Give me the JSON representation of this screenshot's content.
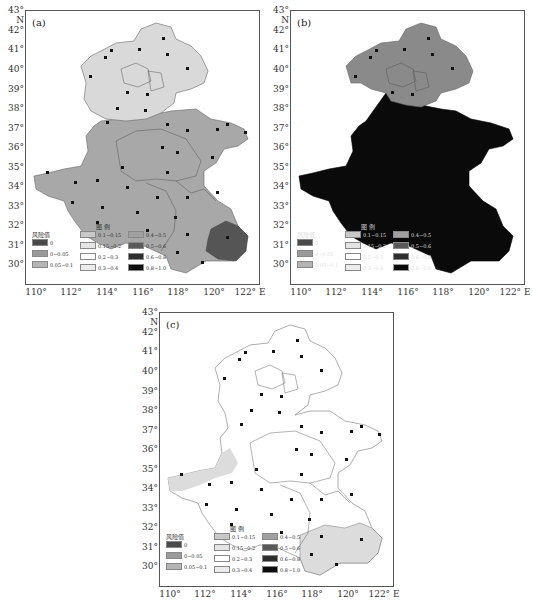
{
  "figure": {
    "panels": [
      {
        "id": "a",
        "label": "(a)"
      },
      {
        "id": "b",
        "label": "(b)"
      },
      {
        "id": "c",
        "label": "(c)"
      }
    ],
    "y_ticks": [
      "43° N",
      "42°",
      "41°",
      "40°",
      "39°",
      "38°",
      "37°",
      "36°",
      "35°",
      "34°",
      "33°",
      "32°",
      "31°",
      "30°"
    ],
    "x_ticks": [
      "110°",
      "112°",
      "114°",
      "116°",
      "118°",
      "120°",
      "122° E"
    ],
    "legend": {
      "title": "图  例",
      "header": "风险值",
      "items": [
        {
          "label": "0",
          "color": "#4a4a4a"
        },
        {
          "label": "0~0.05",
          "color": "#9a9a9a"
        },
        {
          "label": "0.05~0.1",
          "color": "#b4b4b4"
        },
        {
          "label": "0.1~0.15",
          "color": "#c8c8c8"
        },
        {
          "label": "0.15~0.2",
          "color": "#e4e4e4"
        },
        {
          "label": "0.2~0.3",
          "color": "#ffffff"
        },
        {
          "label": "0.3~0.4",
          "color": "#ececec"
        },
        {
          "label": "0.4~0.5",
          "color": "#a0a0a0"
        },
        {
          "label": "0.5~0.6",
          "color": "#5a5a5a"
        },
        {
          "label": "0.6~0.8",
          "color": "#2e2e2e"
        },
        {
          "label": "0.8~1.0",
          "color": "#0c0c0c"
        }
      ]
    },
    "map_labels": {
      "beijing": "北京市",
      "tianjin": "天津市",
      "hebei": "河北省",
      "shandong": "山东省",
      "henan": "河南省",
      "anhui": "安徽省",
      "jiangsu": "江苏省",
      "stations_sample": [
        "围场",
        "张北",
        "张家口",
        "丰宁",
        "承德",
        "怀来",
        "遵化",
        "秦皇岛",
        "蔚县",
        "保定",
        "霸州",
        "天津",
        "塘沽",
        "石家庄",
        "饶阳",
        "黄骅",
        "邢台",
        "南宫",
        "德州",
        "惠民",
        "龙口",
        "烟台",
        "威海",
        "成山头",
        "潍坊",
        "济南",
        "泰山",
        "青岛",
        "日照",
        "三门峡",
        "卢氏",
        "郑州",
        "开封",
        "商丘",
        "许昌",
        "驻马店",
        "信阳",
        "徐州",
        "淮阴",
        "蚌埠",
        "合肥",
        "南京",
        "东台",
        "吕泗",
        "上海",
        "安庆",
        "黄山"
      ]
    },
    "panel_colors": {
      "a": {
        "north": "#d9d9d9",
        "south": "#a8a8a8",
        "southeast": "#555555"
      },
      "b": {
        "north": "#8a8a8a",
        "south": "#0a0a0a"
      },
      "c": {
        "north": "#ffffff",
        "west_patch": "#dcdcdc",
        "southeast": "#dcdcdc"
      }
    }
  }
}
